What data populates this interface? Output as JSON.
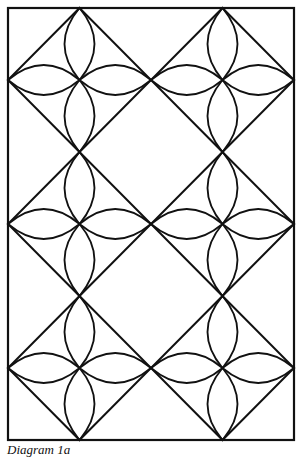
{
  "figure": {
    "caption": "Diagram 1a",
    "stroke_color": "#111111",
    "background": "#ffffff",
    "frame": {
      "x": 8,
      "y": 8,
      "width": 286,
      "height": 432
    },
    "grid": {
      "columns": 2,
      "rows": 3
    },
    "diamonds": [
      {
        "cx": 79.5,
        "cy": 80,
        "hw": 71.5,
        "hh": 72
      },
      {
        "cx": 222.5,
        "cy": 80,
        "hw": 71.5,
        "hh": 72
      },
      {
        "cx": 79.5,
        "cy": 224,
        "hw": 71.5,
        "hh": 72
      },
      {
        "cx": 222.5,
        "cy": 224,
        "hw": 71.5,
        "hh": 72
      },
      {
        "cx": 79.5,
        "cy": 368,
        "hw": 71.5,
        "hh": 72
      },
      {
        "cx": 222.5,
        "cy": 368,
        "hw": 71.5,
        "hh": 72
      }
    ],
    "petal_bulge": 15
  }
}
